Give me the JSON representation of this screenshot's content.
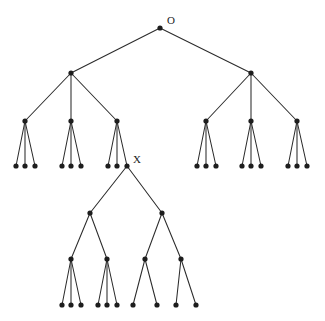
{
  "figure": {
    "background_color": "#ffffff",
    "node_color": "#1d1d1d",
    "edge_color": "#2b2b2b",
    "node_radius": 2.6,
    "width": 325,
    "height": 321
  },
  "labels": {
    "root": "O",
    "marked_node": "X"
  },
  "chart_data": {
    "type": "diagram",
    "subtype": "tree-graph",
    "node_count": 45,
    "edge_count": 44,
    "nodes": [
      {
        "id": "O",
        "x": 160,
        "y": 28,
        "label": "O",
        "label_x": 167,
        "label_y": 24,
        "level": 0
      },
      {
        "id": "L",
        "x": 71,
        "y": 73,
        "label": "",
        "level": 1
      },
      {
        "id": "R",
        "x": 251,
        "y": 73,
        "label": "",
        "level": 1
      },
      {
        "id": "L1",
        "x": 25,
        "y": 121,
        "label": "",
        "level": 2
      },
      {
        "id": "L2",
        "x": 71,
        "y": 121,
        "label": "",
        "level": 2
      },
      {
        "id": "L3",
        "x": 117,
        "y": 121,
        "label": "",
        "level": 2
      },
      {
        "id": "R1",
        "x": 206,
        "y": 121,
        "label": "",
        "level": 2
      },
      {
        "id": "R2",
        "x": 251,
        "y": 121,
        "label": "",
        "level": 2
      },
      {
        "id": "R3",
        "x": 297,
        "y": 121,
        "label": "",
        "level": 2
      },
      {
        "id": "L1a",
        "x": 16,
        "y": 166,
        "label": "",
        "level": 3
      },
      {
        "id": "L1b",
        "x": 25,
        "y": 166,
        "label": "",
        "level": 3
      },
      {
        "id": "L1c",
        "x": 35,
        "y": 166,
        "label": "",
        "level": 3
      },
      {
        "id": "L2a",
        "x": 62,
        "y": 166,
        "label": "",
        "level": 3
      },
      {
        "id": "L2b",
        "x": 71,
        "y": 166,
        "label": "",
        "level": 3
      },
      {
        "id": "L2c",
        "x": 81,
        "y": 166,
        "label": "",
        "level": 3
      },
      {
        "id": "L3a",
        "x": 108,
        "y": 166,
        "label": "",
        "level": 3
      },
      {
        "id": "L3b",
        "x": 117,
        "y": 166,
        "label": "",
        "level": 3
      },
      {
        "id": "X",
        "x": 127,
        "y": 166,
        "label": "X",
        "label_x": 133,
        "label_y": 163,
        "level": 3
      },
      {
        "id": "R1a",
        "x": 197,
        "y": 166,
        "label": "",
        "level": 3
      },
      {
        "id": "R1b",
        "x": 206,
        "y": 166,
        "label": "",
        "level": 3
      },
      {
        "id": "R1c",
        "x": 216,
        "y": 166,
        "label": "",
        "level": 3
      },
      {
        "id": "R2a",
        "x": 242,
        "y": 166,
        "label": "",
        "level": 3
      },
      {
        "id": "R2b",
        "x": 251,
        "y": 166,
        "label": "",
        "level": 3
      },
      {
        "id": "R2c",
        "x": 261,
        "y": 166,
        "label": "",
        "level": 3
      },
      {
        "id": "R3a",
        "x": 288,
        "y": 166,
        "label": "",
        "level": 3
      },
      {
        "id": "R3b",
        "x": 297,
        "y": 166,
        "label": "",
        "level": 3
      },
      {
        "id": "R3c",
        "x": 307,
        "y": 166,
        "label": "",
        "level": 3
      },
      {
        "id": "XA",
        "x": 90,
        "y": 213,
        "label": "",
        "level": 4
      },
      {
        "id": "XB",
        "x": 162,
        "y": 213,
        "label": "",
        "level": 4
      },
      {
        "id": "XA1",
        "x": 71,
        "y": 259,
        "label": "",
        "level": 5
      },
      {
        "id": "XA2",
        "x": 107,
        "y": 259,
        "label": "",
        "level": 5
      },
      {
        "id": "XB1",
        "x": 145,
        "y": 259,
        "label": "",
        "level": 5
      },
      {
        "id": "XB2",
        "x": 181,
        "y": 259,
        "label": "",
        "level": 5
      },
      {
        "id": "XA1a",
        "x": 62,
        "y": 305,
        "label": "",
        "level": 6
      },
      {
        "id": "XA1b",
        "x": 71,
        "y": 305,
        "label": "",
        "level": 6
      },
      {
        "id": "XA1c",
        "x": 81,
        "y": 305,
        "label": "",
        "level": 6
      },
      {
        "id": "XA2a",
        "x": 98,
        "y": 305,
        "label": "",
        "level": 6
      },
      {
        "id": "XA2b",
        "x": 107,
        "y": 305,
        "label": "",
        "level": 6
      },
      {
        "id": "XA2c",
        "x": 117,
        "y": 305,
        "label": "",
        "level": 6
      },
      {
        "id": "XB1a",
        "x": 133,
        "y": 305,
        "label": "",
        "level": 6
      },
      {
        "id": "XB1b",
        "x": 157,
        "y": 305,
        "label": "",
        "level": 6
      },
      {
        "id": "XB2a",
        "x": 176,
        "y": 305,
        "label": "",
        "level": 6
      },
      {
        "id": "XB2b",
        "x": 196,
        "y": 305,
        "label": "",
        "level": 6
      }
    ],
    "edges": [
      [
        "O",
        "L"
      ],
      [
        "O",
        "R"
      ],
      [
        "L",
        "L1"
      ],
      [
        "L",
        "L2"
      ],
      [
        "L",
        "L3"
      ],
      [
        "R",
        "R1"
      ],
      [
        "R",
        "R2"
      ],
      [
        "R",
        "R3"
      ],
      [
        "L1",
        "L1a"
      ],
      [
        "L1",
        "L1b"
      ],
      [
        "L1",
        "L1c"
      ],
      [
        "L2",
        "L2a"
      ],
      [
        "L2",
        "L2b"
      ],
      [
        "L2",
        "L2c"
      ],
      [
        "L3",
        "L3a"
      ],
      [
        "L3",
        "L3b"
      ],
      [
        "L3",
        "X"
      ],
      [
        "R1",
        "R1a"
      ],
      [
        "R1",
        "R1b"
      ],
      [
        "R1",
        "R1c"
      ],
      [
        "R2",
        "R2a"
      ],
      [
        "R2",
        "R2b"
      ],
      [
        "R2",
        "R2c"
      ],
      [
        "R3",
        "R3a"
      ],
      [
        "R3",
        "R3b"
      ],
      [
        "R3",
        "R3c"
      ],
      [
        "X",
        "XA"
      ],
      [
        "X",
        "XB"
      ],
      [
        "XA",
        "XA1"
      ],
      [
        "XA",
        "XA2"
      ],
      [
        "XB",
        "XB1"
      ],
      [
        "XB",
        "XB2"
      ],
      [
        "XA1",
        "XA1a"
      ],
      [
        "XA1",
        "XA1b"
      ],
      [
        "XA1",
        "XA1c"
      ],
      [
        "XA2",
        "XA2a"
      ],
      [
        "XA2",
        "XA2b"
      ],
      [
        "XA2",
        "XA2c"
      ],
      [
        "XB1",
        "XB1a"
      ],
      [
        "XB1",
        "XB1b"
      ],
      [
        "XB2",
        "XB2a"
      ],
      [
        "XB2",
        "XB2b"
      ]
    ]
  }
}
